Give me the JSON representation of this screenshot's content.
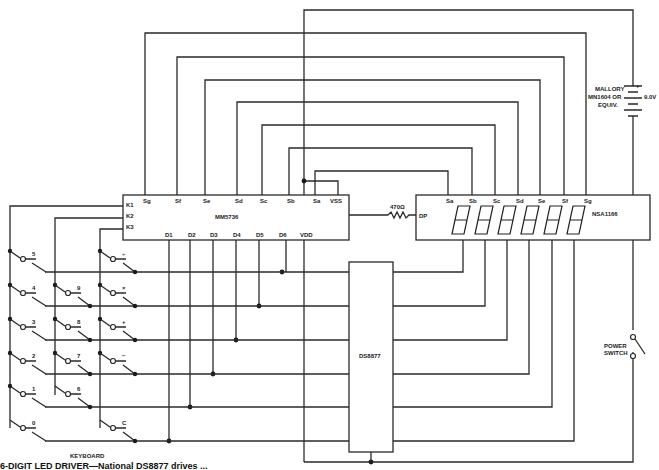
{
  "caption": "6-DIGIT LED DRIVER—National DS8877 drives ...",
  "controller": {
    "name": "MM5736",
    "top_pins": [
      "Sg",
      "Sf",
      "Se",
      "Sd",
      "Sc",
      "Sb",
      "Sa",
      "VSS"
    ],
    "left_pins": [
      "K1",
      "K2",
      "K3"
    ],
    "bottom_pins": [
      "D1",
      "D2",
      "D3",
      "D4",
      "D5",
      "D6",
      "VDD"
    ]
  },
  "display": {
    "name": "NSA1166",
    "dp_label": "DP",
    "top_pins": [
      "Sa",
      "Sb",
      "Sc",
      "Sd",
      "Se",
      "Sf",
      "Sg"
    ],
    "digits": 6
  },
  "driver": {
    "name": "DS8877"
  },
  "resistor": {
    "label": "470Ω"
  },
  "battery": {
    "label_lines": [
      "MALLORY",
      "MN1604 OR",
      "EQUIV."
    ],
    "voltage": "9.0V",
    "plus": "+",
    "minus": "-"
  },
  "power_switch": {
    "label_lines": [
      "POWER",
      "SWITCH"
    ]
  },
  "keyboard": {
    "label": "KEYBOARD",
    "col1_keys": [
      "5",
      "4",
      "3",
      "2",
      "1",
      "0"
    ],
    "col2_keys": [
      "9",
      "8",
      "7",
      "6"
    ],
    "col3_keys": [
      "÷",
      "×",
      "+",
      "−",
      "C"
    ]
  }
}
